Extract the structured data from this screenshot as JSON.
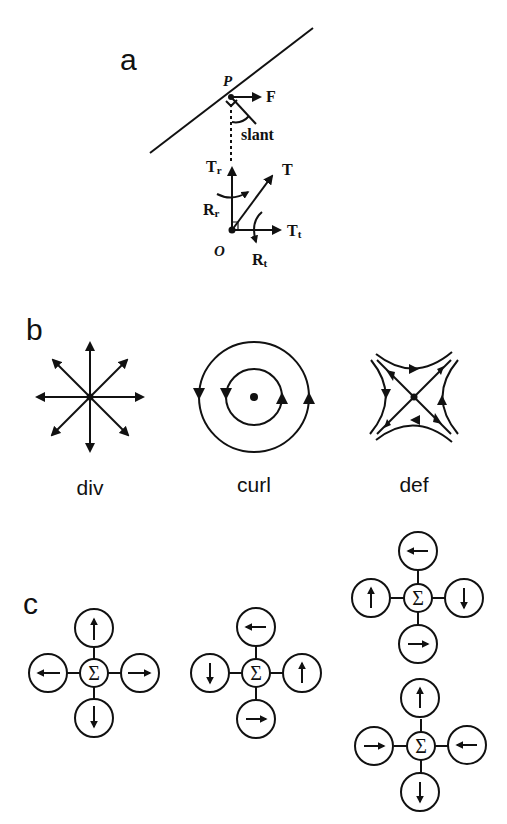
{
  "figure": {
    "panels": [
      {
        "id": "a",
        "label": "a",
        "point_labels": {
          "P": "P",
          "O": "O"
        },
        "vector_labels": {
          "F": "F",
          "slant": "slant",
          "T": "T",
          "Tr_main": "T",
          "Tr_sub": "r",
          "Tt_main": "T",
          "Tt_sub": "t",
          "Rr_main": "R",
          "Rr_sub": "r",
          "Rt_main": "R",
          "Rt_sub": "t"
        }
      },
      {
        "id": "b",
        "label": "b",
        "fields": [
          {
            "name": "div",
            "caption": "div"
          },
          {
            "name": "curl",
            "caption": "curl"
          },
          {
            "name": "def",
            "caption": "def"
          }
        ]
      },
      {
        "id": "c",
        "label": "c",
        "center_symbol": "Σ",
        "clusters": [
          {
            "name": "div-template",
            "top": "up",
            "right": "right",
            "bottom": "down",
            "left": "left"
          },
          {
            "name": "curl-template",
            "top": "left",
            "right": "up",
            "bottom": "right",
            "left": "down"
          },
          {
            "name": "def-template-1",
            "top": "left",
            "right": "down",
            "bottom": "right",
            "left": "up"
          },
          {
            "name": "def-template-2",
            "top": "up",
            "right": "left",
            "bottom": "down",
            "left": "right"
          }
        ]
      }
    ]
  }
}
